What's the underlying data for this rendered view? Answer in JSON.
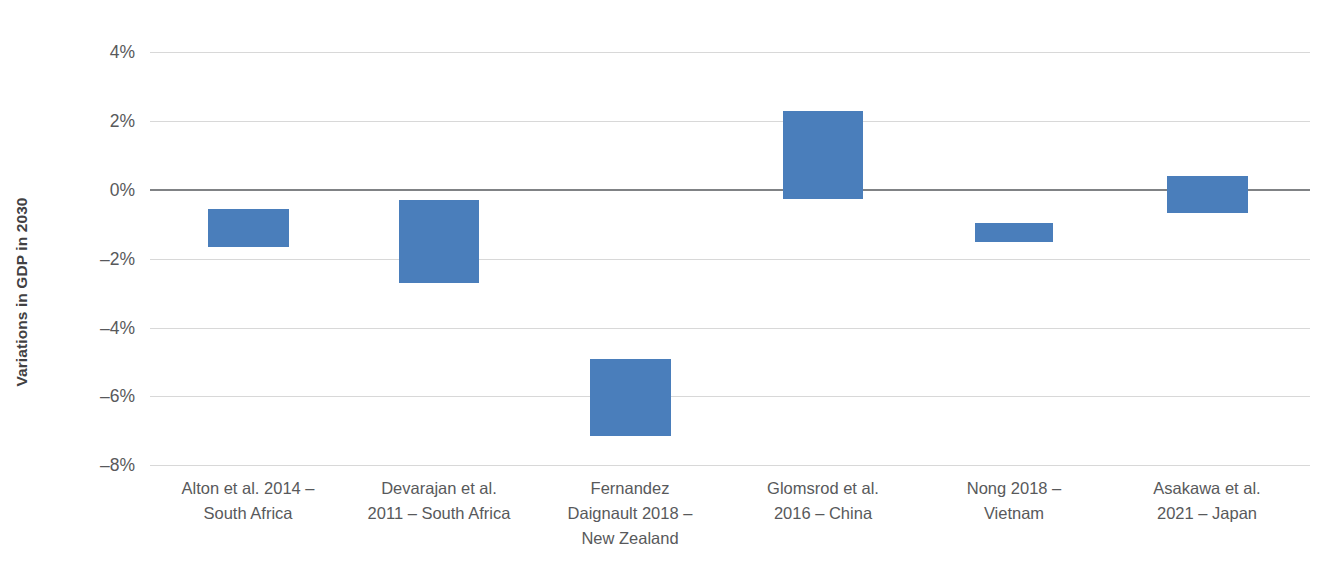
{
  "chart_data": {
    "type": "bar",
    "title": "",
    "subtitle": "",
    "xlabel": "",
    "ylabel": "Variations in GDP in 2030",
    "ylim": [
      -8,
      4
    ],
    "ytick_labels": [
      "4%",
      "2%",
      "0%",
      "–2%",
      "–4%",
      "–6%",
      "–8%"
    ],
    "ytick_values": [
      4,
      2,
      0,
      -2,
      -4,
      -6,
      -8
    ],
    "grid": "horizontal",
    "legend": "none",
    "bar_style": "floating range bars (low–high interval per study)",
    "bar_color": "#4a7ebb",
    "categories": [
      "Alton et al. 2014 – South Africa",
      "Devarajan et al. 2011 – South Africa",
      "Fernandez Daignault 2018 – New Zealand",
      "Glomsrod et al. 2016 – China",
      "Nong 2018 – Vietnam",
      "Asakawa et al. 2021 – Japan"
    ],
    "category_lines": [
      [
        "Alton et al. 2014 –",
        "South Africa"
      ],
      [
        "Devarajan et al.",
        "2011 – South Africa"
      ],
      [
        "Fernandez",
        "Daignault 2018 –",
        "New Zealand"
      ],
      [
        "Glomsrod et al.",
        "2016 – China"
      ],
      [
        "Nong 2018 –",
        "Vietnam"
      ],
      [
        "Asakawa et al.",
        "2021 – Japan"
      ]
    ],
    "series": [
      {
        "name": "high",
        "values": [
          -0.55,
          -0.3,
          -4.9,
          2.3,
          -0.95,
          0.4
        ]
      },
      {
        "name": "low",
        "values": [
          -1.65,
          -2.7,
          -7.15,
          -0.25,
          -1.5,
          -0.67
        ]
      }
    ]
  },
  "axis": {
    "y_title": "Variations in GDP in 2030"
  },
  "geometry": {
    "bars": [
      {
        "left": 58,
        "width": 81,
        "top_value": -0.55,
        "bottom_value": -1.65
      },
      {
        "left": 249,
        "width": 80,
        "top_value": -0.3,
        "bottom_value": -2.7
      },
      {
        "left": 440,
        "width": 81,
        "top_value": -4.9,
        "bottom_value": -7.15
      },
      {
        "left": 633,
        "width": 80,
        "top_value": 2.3,
        "bottom_value": -0.25
      },
      {
        "left": 825,
        "width": 78,
        "top_value": -0.95,
        "bottom_value": -1.5
      },
      {
        "left": 1017,
        "width": 81,
        "top_value": 0.4,
        "bottom_value": -0.67
      }
    ],
    "label_centers": [
      98,
      289,
      480,
      673,
      864,
      1057
    ],
    "label_width": 230,
    "y_zero_px": 190,
    "px_per_percent": 34.4
  }
}
